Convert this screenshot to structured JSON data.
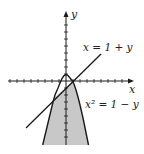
{
  "diagram": {
    "type": "region-plot",
    "axes": {
      "x_label": "x",
      "y_label": "y"
    },
    "curves": [
      {
        "name": "line",
        "equation": "x = 1 + y",
        "label": "x = 1 + y"
      },
      {
        "name": "parabola",
        "equation": "x^2 = 1 - y",
        "label": "x² = 1 − y"
      }
    ],
    "intersections": [
      [
        -2,
        -3
      ],
      [
        1,
        0
      ]
    ],
    "shaded_region": "bounded by parabola x^2 = 1 - y, extended below",
    "colors": {
      "shade": "#c8c8c8",
      "stroke": "#1a1a1a"
    }
  }
}
